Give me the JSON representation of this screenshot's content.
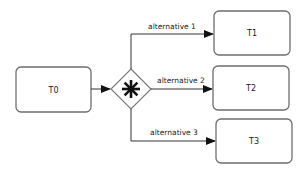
{
  "diagram": {
    "type": "BPMN process fragment",
    "tasks": [
      {
        "id": "T0",
        "label": "T0"
      },
      {
        "id": "T1",
        "label": "T1"
      },
      {
        "id": "T2",
        "label": "T2"
      },
      {
        "id": "T3",
        "label": "T3"
      }
    ],
    "gateway": {
      "kind": "complex-gateway",
      "icon": "asterisk-icon"
    },
    "flows": [
      {
        "from": "T0",
        "to": "gateway",
        "label": ""
      },
      {
        "from": "gateway",
        "to": "T1",
        "label": "alternative 1"
      },
      {
        "from": "gateway",
        "to": "T2",
        "label": "alternative 2"
      },
      {
        "from": "gateway",
        "to": "T3",
        "label": "alternative 3"
      }
    ],
    "colors": {
      "stroke": "#6e6e6e",
      "arrow": "#111111",
      "background": "#ffffff"
    }
  }
}
